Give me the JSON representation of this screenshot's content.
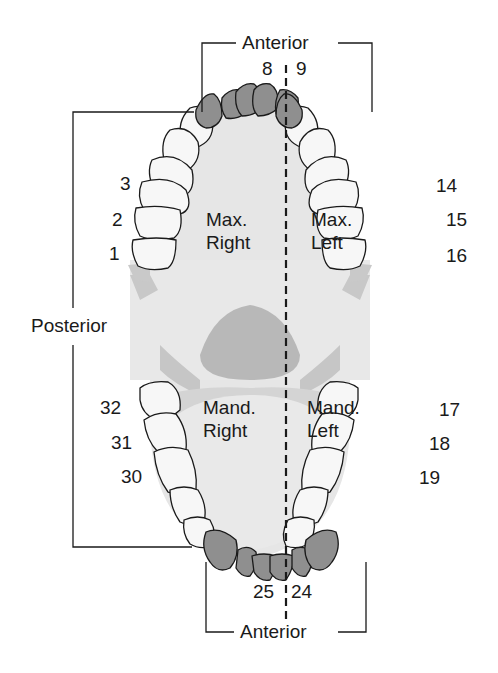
{
  "diagram": {
    "labels": {
      "anterior_top": "Anterior",
      "anterior_bottom": "Anterior",
      "posterior": "Posterior"
    },
    "quadrants": {
      "max_right": {
        "line1": "Max.",
        "line2": "Right"
      },
      "max_left": {
        "line1": "Max.",
        "line2": "Left"
      },
      "mand_right": {
        "line1": "Mand.",
        "line2": "Right"
      },
      "mand_left": {
        "line1": "Mand.",
        "line2": "Left"
      }
    },
    "tooth_numbers": {
      "t8": "8",
      "t9": "9",
      "t3": "3",
      "t2": "2",
      "t1": "1",
      "t14": "14",
      "t15": "15",
      "t16": "16",
      "t32": "32",
      "t31": "31",
      "t30": "30",
      "t17": "17",
      "t18": "18",
      "t19": "19",
      "t25": "25",
      "t24": "24"
    },
    "colors": {
      "anterior_teeth": "#8f8f8f",
      "posterior_teeth": "#f7f7f7",
      "palate": "#e6e6e6",
      "tongue_dark": "#b5b5b5",
      "outline": "#1a1a1a"
    }
  }
}
